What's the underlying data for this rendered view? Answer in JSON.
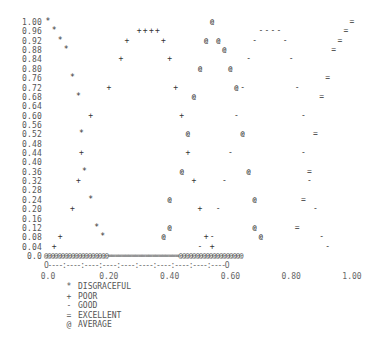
{
  "chart_data": {
    "type": "scatter",
    "title": "",
    "xlabel": "",
    "ylabel": "",
    "xlim": [
      0.0,
      1.0
    ],
    "ylim": [
      0.0,
      1.0
    ],
    "x_tick_labels": [
      "0.0",
      "0.20",
      "0.40",
      "0.60",
      "0.80",
      "1.00"
    ],
    "y_tick_labels": [
      "1.00",
      "0.96",
      "0.92",
      "0.88",
      "0.84",
      "0.80",
      "0.76",
      "0.72",
      "0.68",
      "0.64",
      "0.60",
      "0.56",
      "0.52",
      "0.48",
      "0.44",
      "0.40",
      "0.36",
      "0.32",
      "0.28",
      "0.24",
      "0.20",
      "0.16",
      "0.12",
      "0.08",
      "0.04",
      "0.0"
    ],
    "x_axis_string": "O----:----:----:----:----:----:----:----:----:----O",
    "baseline_string": "@@@@@@@@@@@@@@@@@@@=====================@@@@@@@@@@@@@@@@@@@",
    "legend_position": "bottom-left",
    "series": [
      {
        "name": "DISGRACEFUL",
        "symbol": "*",
        "points": [
          [
            0.0,
            1.0
          ],
          [
            0.02,
            0.96
          ],
          [
            0.04,
            0.92
          ],
          [
            0.06,
            0.88
          ],
          [
            0.08,
            0.76
          ],
          [
            0.1,
            0.68
          ],
          [
            0.11,
            0.52
          ],
          [
            0.12,
            0.36
          ],
          [
            0.14,
            0.24
          ],
          [
            0.16,
            0.12
          ],
          [
            0.18,
            0.08
          ]
        ]
      },
      {
        "name": "POOR",
        "symbol": "+",
        "points": [
          [
            0.02,
            0.04
          ],
          [
            0.04,
            0.08
          ],
          [
            0.08,
            0.2
          ],
          [
            0.1,
            0.32
          ],
          [
            0.11,
            0.44
          ],
          [
            0.14,
            0.6
          ],
          [
            0.2,
            0.72
          ],
          [
            0.24,
            0.84
          ],
          [
            0.26,
            0.92
          ],
          [
            0.3,
            0.96
          ],
          [
            0.32,
            0.96
          ],
          [
            0.34,
            0.96
          ],
          [
            0.36,
            0.96
          ],
          [
            0.38,
            0.92
          ],
          [
            0.4,
            0.84
          ],
          [
            0.42,
            0.72
          ],
          [
            0.44,
            0.6
          ],
          [
            0.46,
            0.44
          ],
          [
            0.48,
            0.32
          ],
          [
            0.5,
            0.2
          ],
          [
            0.52,
            0.08
          ],
          [
            0.54,
            0.04
          ]
        ]
      },
      {
        "name": "GOOD",
        "symbol": "-",
        "points": [
          [
            0.5,
            0.04
          ],
          [
            0.54,
            0.08
          ],
          [
            0.56,
            0.2
          ],
          [
            0.58,
            0.32
          ],
          [
            0.6,
            0.44
          ],
          [
            0.62,
            0.6
          ],
          [
            0.64,
            0.72
          ],
          [
            0.66,
            0.84
          ],
          [
            0.68,
            0.92
          ],
          [
            0.7,
            0.96
          ],
          [
            0.72,
            0.96
          ],
          [
            0.74,
            0.96
          ],
          [
            0.76,
            0.96
          ],
          [
            0.78,
            0.92
          ],
          [
            0.8,
            0.84
          ],
          [
            0.82,
            0.72
          ],
          [
            0.84,
            0.6
          ],
          [
            0.84,
            0.44
          ],
          [
            0.86,
            0.32
          ],
          [
            0.88,
            0.2
          ],
          [
            0.9,
            0.08
          ],
          [
            0.92,
            0.04
          ]
        ]
      },
      {
        "name": "EXCELLENT",
        "symbol": "=",
        "points": [
          [
            0.82,
            0.12
          ],
          [
            0.84,
            0.24
          ],
          [
            0.86,
            0.36
          ],
          [
            0.88,
            0.52
          ],
          [
            0.9,
            0.68
          ],
          [
            0.92,
            0.76
          ],
          [
            0.94,
            0.88
          ],
          [
            0.96,
            0.92
          ],
          [
            0.98,
            0.96
          ],
          [
            1.0,
            1.0
          ]
        ]
      },
      {
        "name": "AVERAGE",
        "symbol": "@",
        "points": [
          [
            0.38,
            0.08
          ],
          [
            0.4,
            0.12
          ],
          [
            0.4,
            0.24
          ],
          [
            0.44,
            0.36
          ],
          [
            0.46,
            0.52
          ],
          [
            0.48,
            0.68
          ],
          [
            0.5,
            0.8
          ],
          [
            0.52,
            0.92
          ],
          [
            0.54,
            1.0
          ],
          [
            0.56,
            0.92
          ],
          [
            0.58,
            0.88
          ],
          [
            0.6,
            0.8
          ],
          [
            0.62,
            0.72
          ],
          [
            0.64,
            0.52
          ],
          [
            0.66,
            0.36
          ],
          [
            0.68,
            0.24
          ],
          [
            0.68,
            0.12
          ],
          [
            0.7,
            0.08
          ]
        ]
      }
    ]
  },
  "legend": [
    {
      "symbol": "*",
      "label": "DISGRACEFUL"
    },
    {
      "symbol": "+",
      "label": "POOR"
    },
    {
      "symbol": "-",
      "label": "GOOD"
    },
    {
      "symbol": "=",
      "label": "EXCELLENT"
    },
    {
      "symbol": "@",
      "label": "AVERAGE"
    }
  ]
}
